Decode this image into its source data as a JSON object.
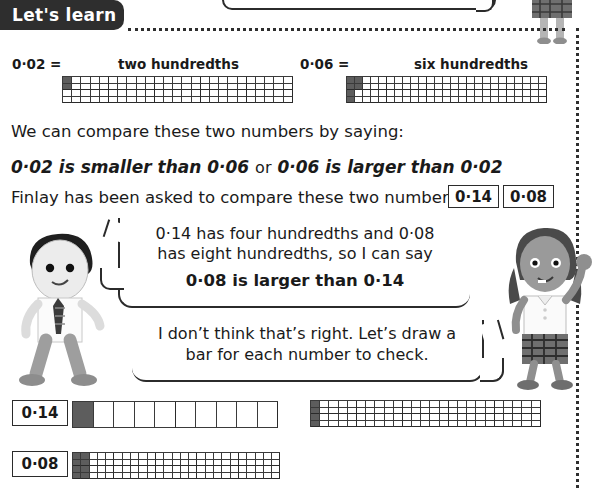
{
  "tab": {
    "label": "Let's learn"
  },
  "examples": [
    {
      "number": "0·02",
      "equals": "=",
      "words": "two hundredths",
      "shaded": 2
    },
    {
      "number": "0·06",
      "equals": "=",
      "words": "six hundredths",
      "shaded": 6
    }
  ],
  "body": {
    "line1": "We can compare these two numbers by saying:",
    "line2_a": "0·02 is smaller than 0·06",
    "line2_or": "or",
    "line2_b": "0·06 is larger than 0·02",
    "line3": "Finlay has been asked to compare these two numbers:"
  },
  "number_boxes": {
    "first": "0·14",
    "second": "0·08"
  },
  "speech": {
    "boy": {
      "line1": "0·14 has four hundredths and 0·08",
      "line2": "has eight hundredths, so I can say",
      "conclusion": "0·08 is larger than 0·14"
    },
    "girl": {
      "line1": "I don’t think that’s right. Let’s draw a",
      "line2": "bar for each number to check."
    }
  },
  "bar_models": [
    {
      "label": "0·14",
      "type": "tenths",
      "cells": 10,
      "shaded": 1
    },
    {
      "label": "0·08",
      "type": "hundredths",
      "cells": 100,
      "shaded": 8
    },
    {
      "label": "0·14",
      "type": "hundredths",
      "cells": 100,
      "shaded": 4
    }
  ],
  "characters": {
    "boy_name": "boy-character-finlay",
    "girl_name": "girl-character-isla",
    "girl_top_name": "girl-character-top"
  },
  "colors": {
    "ink": "#2b2b2b",
    "shade": "#5d5d5d",
    "tab_bg": "#2e2e2e",
    "grid_line": "#3a3a3a"
  }
}
